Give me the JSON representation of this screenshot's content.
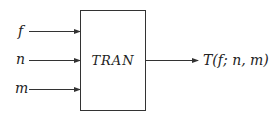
{
  "diagram": {
    "block": {
      "label": "TRAN"
    },
    "inputs": [
      {
        "label": "f"
      },
      {
        "label": "n"
      },
      {
        "label": "m"
      }
    ],
    "output": {
      "label": "T(f; n, m)"
    },
    "colors": {
      "stroke": "#333333",
      "text": "#222222",
      "background": "#ffffff"
    }
  }
}
